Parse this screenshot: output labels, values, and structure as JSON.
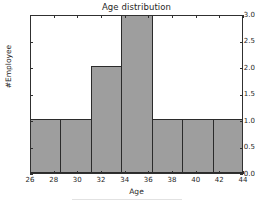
{
  "chart_data": {
    "type": "bar",
    "title": "Age distribution",
    "xlabel": "Age",
    "ylabel": "#Employee",
    "xlim": [
      26,
      44
    ],
    "ylim": [
      0,
      3
    ],
    "grid": false,
    "legend": null,
    "xticks": [
      "26",
      "28",
      "30",
      "32",
      "34",
      "36",
      "38",
      "40",
      "42",
      "44"
    ],
    "xtick_values": [
      26,
      28,
      30,
      32,
      34,
      36,
      38,
      40,
      42,
      44
    ],
    "yticks": [
      "0.0",
      "0.5",
      "1.0",
      "1.5",
      "2.0",
      "2.5",
      "3.0"
    ],
    "ytick_values": [
      0.0,
      0.5,
      1.0,
      1.5,
      2.0,
      2.5,
      3.0
    ],
    "bin_edges": [
      26.0,
      28.571,
      31.143,
      33.714,
      36.286,
      38.857,
      41.429,
      44.0
    ],
    "categories": [
      "26.0-28.6",
      "28.6-31.1",
      "31.1-33.7",
      "33.7-36.3",
      "36.3-38.9",
      "38.9-41.4",
      "41.4-44.0"
    ],
    "values": [
      1,
      1,
      2,
      3,
      1,
      1,
      1
    ],
    "bar_color": "#9e9e9e",
    "bar_edge_color": "#2b2b2b",
    "axes_color": "#303030",
    "background_color": "#ffffff"
  }
}
